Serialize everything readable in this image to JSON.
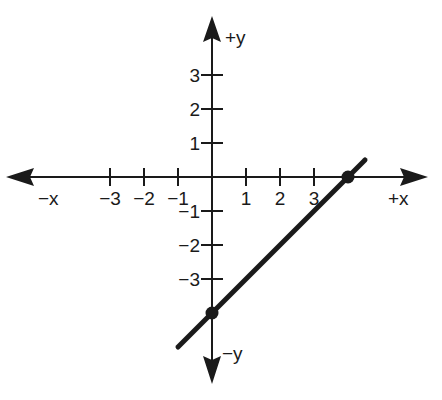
{
  "chart_data": {
    "type": "line",
    "title": "",
    "xlabel_pos": "+x",
    "xlabel_neg": "−x",
    "ylabel_pos": "+y",
    "ylabel_neg": "−y",
    "x_ticks": [
      -3,
      -2,
      -1,
      1,
      2,
      3
    ],
    "y_ticks": [
      -3,
      -2,
      -1,
      1,
      2,
      3
    ],
    "x_tick_labels": [
      "−3",
      "−2",
      "−1",
      "1",
      "2",
      "3"
    ],
    "y_tick_labels": [
      "−3",
      "−2",
      "−1",
      "1",
      "2",
      "3"
    ],
    "grid": false,
    "series": [
      {
        "name": "line",
        "equation": "y = x - 4",
        "x": [
          -1,
          4.5
        ],
        "y": [
          -5,
          0.5
        ]
      }
    ],
    "points": [
      {
        "x": 4,
        "y": 0,
        "label": "x-intercept"
      },
      {
        "x": 0,
        "y": -4,
        "label": "y-intercept"
      }
    ],
    "xlim": [
      -5,
      5.5
    ],
    "ylim": [
      -5.5,
      4.5
    ],
    "color": "#1a1a1a"
  }
}
